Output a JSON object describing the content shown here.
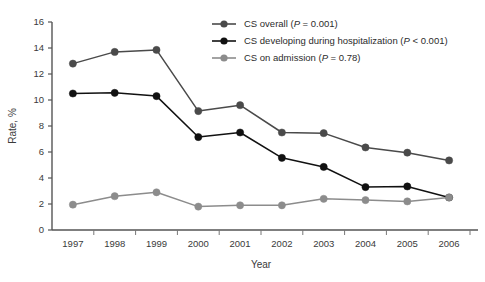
{
  "chart_data": {
    "type": "line",
    "title": "",
    "xlabel": "Year",
    "ylabel": "Rate, %",
    "categories": [
      "1997",
      "1998",
      "1999",
      "2000",
      "2001",
      "2002",
      "2003",
      "2004",
      "2005",
      "2006"
    ],
    "x": [
      1997,
      1998,
      1999,
      2000,
      2001,
      2002,
      2003,
      2004,
      2005,
      2006
    ],
    "ylim": [
      0,
      16
    ],
    "yticks": [
      0,
      2,
      4,
      6,
      8,
      10,
      12,
      14,
      16
    ],
    "xlim": [
      1996.5,
      2006.5
    ],
    "grid": false,
    "legend_position": "top-right",
    "series": [
      {
        "name": "CS overall",
        "pvalue_text": "(P = 0.001)",
        "legend_label": "CS overall (P = 0.001)",
        "color": "#4a4a4a",
        "values": [
          12.8,
          13.7,
          13.85,
          9.15,
          9.6,
          7.5,
          7.45,
          6.35,
          5.95,
          5.35
        ]
      },
      {
        "name": "CS developing during hospitalization",
        "pvalue_text": "(P < 0.001)",
        "legend_label": "CS developing during hospitalization (P < 0.001)",
        "color": "#111111",
        "values": [
          10.5,
          10.55,
          10.3,
          7.15,
          7.5,
          5.55,
          4.85,
          3.3,
          3.35,
          2.5
        ]
      },
      {
        "name": "CS on admission",
        "pvalue_text": "(P = 0.78)",
        "legend_label": "CS on admission (P = 0.78)",
        "color": "#8c8c8c",
        "values": [
          1.95,
          2.6,
          2.9,
          1.8,
          1.9,
          1.9,
          2.4,
          2.3,
          2.2,
          2.5
        ]
      }
    ]
  },
  "legend": {
    "items": [
      {
        "label_main": "CS overall",
        "p_prefix": "(",
        "p_italic": "P",
        "p_suffix": " = 0.001)"
      },
      {
        "label_main": "CS developing during hospitalization",
        "p_prefix": "(",
        "p_italic": "P",
        "p_suffix": " < 0.001)"
      },
      {
        "label_main": "CS on admission",
        "p_prefix": "(",
        "p_italic": "P",
        "p_suffix": " = 0.78)"
      }
    ]
  },
  "axes": {
    "y_title": "Rate, %",
    "x_title": "Year",
    "y_tick_labels": [
      "0",
      "2",
      "4",
      "6",
      "8",
      "10",
      "12",
      "14",
      "16"
    ],
    "x_tick_labels": [
      "1997",
      "1998",
      "1999",
      "2000",
      "2001",
      "2002",
      "2003",
      "2004",
      "2005",
      "2006"
    ]
  }
}
